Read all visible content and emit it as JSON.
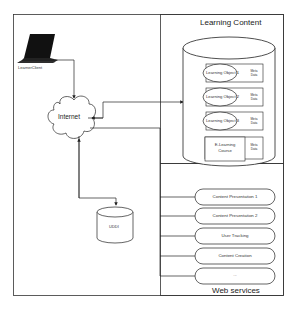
{
  "diagram": {
    "learner_client": {
      "label": "LearnerClient",
      "icon": "laptop-icon"
    },
    "internet": {
      "label": "Internet",
      "icon": "cloud-icon"
    },
    "registry": {
      "label": "UDDI",
      "icon": "database-icon"
    },
    "learning_content": {
      "title": "Learning Content",
      "items": [
        {
          "label": "Learning Object 1",
          "meta": "Meta Data"
        },
        {
          "label": "Learning Object 2",
          "meta": "Meta Data"
        },
        {
          "label": "Learning Object 3",
          "meta": "Meta Data"
        }
      ],
      "course": {
        "label_line1": "E-Learning",
        "label_line2": "Course",
        "meta": "Meta Data"
      }
    },
    "web_services": {
      "title": "Web services",
      "items": [
        {
          "label": "Content Presentation 1"
        },
        {
          "label": "Content Presentation 2"
        },
        {
          "label": "User Tracking"
        },
        {
          "label": "Content Creation"
        },
        {
          "label": "..."
        }
      ]
    },
    "colors": {
      "line": "#222222",
      "fill": "#ffffff",
      "laptop": "#111111"
    }
  }
}
